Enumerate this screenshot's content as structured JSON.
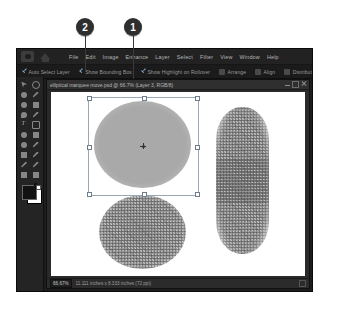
{
  "callouts": [
    {
      "label": "2",
      "x": 85,
      "y": 27,
      "line_to_y": 72
    },
    {
      "label": "1",
      "x": 133,
      "y": 27,
      "line_to_y": 79
    }
  ],
  "app": {
    "icons": {
      "camera": "camera-icon",
      "home": "home-icon"
    },
    "menubar": [
      "File",
      "Edit",
      "Image",
      "Enhance",
      "Layer",
      "Select",
      "Filter",
      "View",
      "Window",
      "Help"
    ],
    "options_bar": {
      "checkboxes": [
        {
          "label": "Auto Select Layer",
          "checked": true
        },
        {
          "label": "Show Bounding Box",
          "checked": true
        },
        {
          "label": "Show Highlight on Rollover",
          "checked": true
        }
      ],
      "dropdowns": [
        "Arrange",
        "Align",
        "Distribute"
      ]
    },
    "toolbox": [
      "move-tool",
      "zoom-tool",
      "hand-tool",
      "eyedropper-tool",
      "quick-select-tool",
      "marquee-tool",
      "lasso-tool",
      "magic-wand-tool",
      "type-tool",
      "crop-tool",
      "cookie-cutter-tool",
      "straighten-tool",
      "redeye-tool",
      "healing-brush-tool",
      "clone-stamp-tool",
      "brush-tool",
      "eraser-tool",
      "paint-bucket-tool",
      "gradient-tool",
      "shape-tool"
    ],
    "swatches": {
      "foreground": "#121212",
      "background": "#ffffff"
    },
    "document": {
      "title": "elliptical marquee move.psd @ 66.7% (Layer 3, RGB/8)",
      "window_buttons": [
        "minimize",
        "maximize",
        "close"
      ],
      "status": {
        "zoom": "66.67%",
        "dimensions": "11.111 inches x 8.333 inches (72 ppi)"
      },
      "shapes": [
        {
          "name": "selected-ellipse",
          "style": "smooth-gray-feathered",
          "selected": true
        },
        {
          "name": "noisy-circle",
          "style": "noise-feathered"
        },
        {
          "name": "noisy-pill",
          "style": "noise-feathered-vertical"
        }
      ]
    }
  },
  "colors": {
    "window_bg": "#1d1d1d",
    "menubar_bg": "#222222",
    "canvas_bg": "#ffffff",
    "selection_blue": "#9aa7b5",
    "check_blue": "#8fb4d8"
  }
}
